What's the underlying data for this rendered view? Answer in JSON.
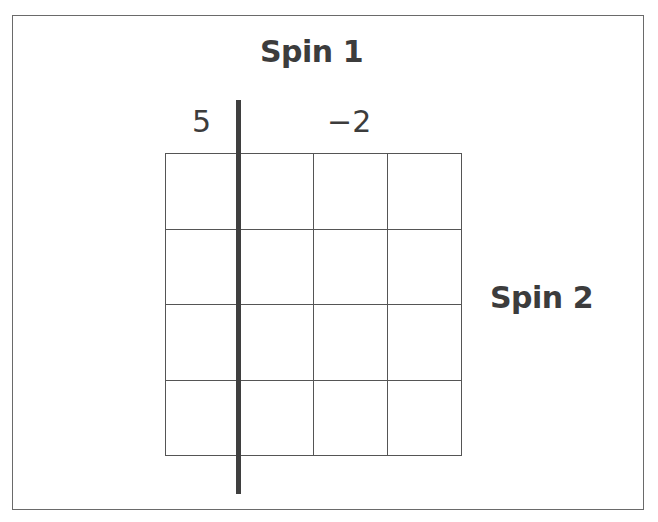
{
  "diagram": {
    "spin1_label": "Spin 1",
    "spin2_label": "Spin 2",
    "spin1_values": [
      "5",
      "−2"
    ],
    "grid": {
      "rows": 4,
      "cols": 4
    },
    "colors": {
      "line": "#3f3f3f",
      "text": "#3c3c3c",
      "frame": "#6a6a6a"
    }
  }
}
